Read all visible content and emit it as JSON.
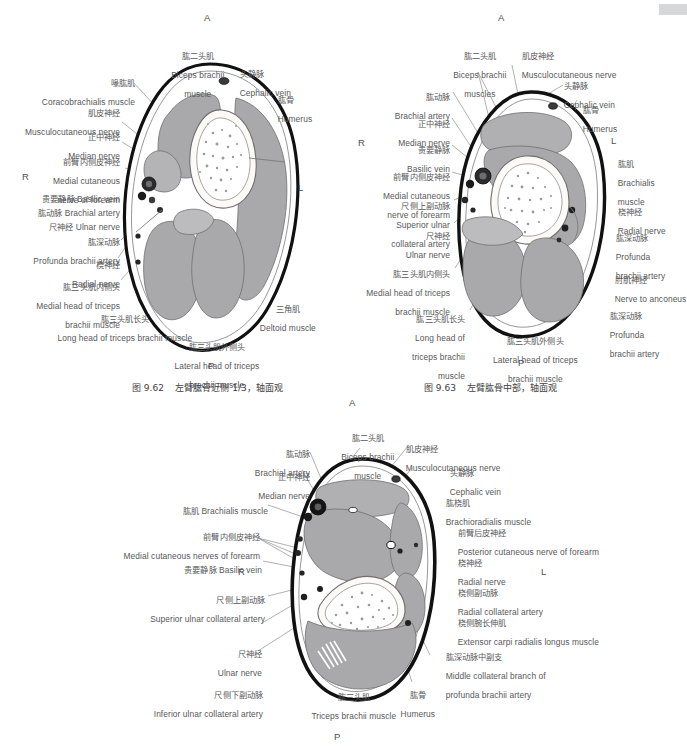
{
  "page": {
    "corner_mark_color": "#d6d7d9",
    "text_color": "#57585a",
    "muscle_fill": "#a9a9ab",
    "muscle_fill_light": "#bcbcbe",
    "bone_fill": "#fbfaf6",
    "skin_outline": "#111111",
    "vessel_dark": "#1b1b1b"
  },
  "figures": [
    {
      "id": "fig-9-62",
      "caption": "图 9.62    左臂肱骨近侧 1/3，轴面观",
      "caption_number": "图 9.62",
      "caption_text": "左臂肱骨近侧 1/3，轴面观",
      "orientation": {
        "anterior": "A",
        "posterior": "P",
        "right": "R",
        "left": "L"
      },
      "labels": [
        {
          "cn": "肱二头肌",
          "en": "Biceps brachii\nmuscle",
          "align": "center"
        },
        {
          "cn": "喙肱肌",
          "en": "Coracobrachialis muscle",
          "align": "right"
        },
        {
          "cn": "肌皮神经",
          "en": "Musculocutaneous nerve",
          "align": "right"
        },
        {
          "cn": "正中神经",
          "en": "Median nerve",
          "align": "right"
        },
        {
          "cn": "前臂内侧皮神经",
          "en": "Medial cutaneous\nnerve of forearm",
          "align": "right"
        },
        {
          "cn": "贵要静脉",
          "en": "Basilic vein",
          "align": "right"
        },
        {
          "cn": "肱动脉",
          "en": "Brachial artery",
          "align": "right"
        },
        {
          "cn": "尺神经",
          "en": "Ulnar nerve",
          "align": "right"
        },
        {
          "cn": "肱深动脉",
          "en": "Profunda brachii artery",
          "align": "right"
        },
        {
          "cn": "桡神经",
          "en": "Radial nerve",
          "align": "right"
        },
        {
          "cn": "肱三头肌内侧头",
          "en": "Medial head of triceps\nbrachii muscle",
          "align": "right"
        },
        {
          "cn": "肱三头肌长头",
          "en": "Long head of triceps brachii muscle",
          "align": "right"
        },
        {
          "cn": "肱三头肌外侧头",
          "en": "Lateral head of triceps\nbrachii muscle",
          "align": "center"
        },
        {
          "cn": "三角肌",
          "en": "Deltoid muscle",
          "align": "left"
        },
        {
          "cn": "头静脉",
          "en": "Cephalic vein",
          "align": "left"
        },
        {
          "cn": "肱骨",
          "en": "Humerus",
          "align": "left"
        }
      ]
    },
    {
      "id": "fig-9-63",
      "caption": "图 9.63    左臂肱骨中部，轴面观",
      "caption_number": "图 9.63",
      "caption_text": "左臂肱骨中部，轴面观",
      "orientation": {
        "anterior": "A",
        "posterior": "P",
        "right": "R",
        "left": "L"
      },
      "labels": [
        {
          "cn": "肱二头肌",
          "en": "Biceps brachii\nmuscles",
          "align": "center"
        },
        {
          "cn": "肌皮神经",
          "en": "Musculocutaneous nerve",
          "align": "left"
        },
        {
          "cn": "头静脉",
          "en": "Cephalic vein",
          "align": "left"
        },
        {
          "cn": "肱骨",
          "en": "Humerus",
          "align": "left"
        },
        {
          "cn": "肱动脉",
          "en": "Brachial artery",
          "align": "right"
        },
        {
          "cn": "正中神经",
          "en": "Median nerve",
          "align": "right"
        },
        {
          "cn": "贵要静脉",
          "en": "Basilic vein",
          "align": "right"
        },
        {
          "cn": "前臂内侧皮神经",
          "en": "Medial cutaneous\nnerve of forearm",
          "align": "right"
        },
        {
          "cn": "尺侧上副动脉",
          "en": "Superior ulnar\ncollateral artery",
          "align": "right"
        },
        {
          "cn": "尺神经",
          "en": "Ulnar nerve",
          "align": "right"
        },
        {
          "cn": "肱三头肌内侧头",
          "en": "Medial head of triceps\nbrachii muscle",
          "align": "right"
        },
        {
          "cn": "肱三头肌长头",
          "en": "Long head of\ntriceps brachii\nmuscle",
          "align": "right"
        },
        {
          "cn": "肱三头肌外侧头",
          "en": "Lateral head of triceps\nbrachii muscle",
          "align": "center"
        },
        {
          "cn": "肱肌",
          "en": "Brachialis\nmuscle",
          "align": "left"
        },
        {
          "cn": "桡神经",
          "en": "Radial nerve",
          "align": "left"
        },
        {
          "cn": "肱深动脉",
          "en": "Profunda\nbrachii artery",
          "align": "left"
        },
        {
          "cn": "肘肌神经",
          "en": "Nerve to anconeus",
          "align": "left"
        },
        {
          "cn": "肱深动脉",
          "en": "Profunda\nbrachii artery",
          "align": "left"
        }
      ]
    },
    {
      "id": "fig-9-64",
      "caption": "",
      "orientation": {
        "anterior": "A",
        "posterior": "P",
        "right": "R",
        "left": "L"
      },
      "labels": [
        {
          "cn": "肱二头肌",
          "en": "Biceps brachii\nmuscle",
          "align": "center"
        },
        {
          "cn": "肱动脉",
          "en": "Brachial artery",
          "align": "right"
        },
        {
          "cn": "正中神经",
          "en": "Median nerve",
          "align": "right"
        },
        {
          "cn": "肱肌",
          "en": "Brachialis muscle",
          "align": "right",
          "inline": true
        },
        {
          "cn": "前臂内侧皮神经",
          "en": "Medial cutaneous nerves of forearm",
          "align": "right"
        },
        {
          "cn": "贵要静脉",
          "en": "Basilic vein",
          "align": "right",
          "inline": true
        },
        {
          "cn": "尺侧上副动脉",
          "en": "Superior ulnar collateral artery",
          "align": "right"
        },
        {
          "cn": "尺神经",
          "en": "Ulnar nerve",
          "align": "right"
        },
        {
          "cn": "尺侧下副动脉",
          "en": "Inferior ulnar collateral artery",
          "align": "right"
        },
        {
          "cn": "肱三头肌",
          "en": "Triceps brachii muscle",
          "align": "center"
        },
        {
          "cn": "肱骨",
          "en": "Humerus",
          "align": "center"
        },
        {
          "cn": "肌皮神经",
          "en": "Musculocutaneous nerve",
          "align": "left"
        },
        {
          "cn": "头静脉",
          "en": "Cephalic vein",
          "align": "left"
        },
        {
          "cn": "肱桡肌",
          "en": "Brachioradialis muscle",
          "align": "left"
        },
        {
          "cn": "前臂后皮神经",
          "en": "Posterior cutaneous nerve of forearm",
          "align": "left"
        },
        {
          "cn": "桡神经",
          "en": "Radial nerve",
          "align": "left"
        },
        {
          "cn": "桡侧副动脉",
          "en": "Radial collateral artery",
          "align": "left"
        },
        {
          "cn": "桡侧腕长伸肌",
          "en": "Extensor carpi radialis longus muscle",
          "align": "left"
        },
        {
          "cn": "肱深动脉中副支",
          "en": "Middle collateral branch of\nprofunda brachii artery",
          "align": "left"
        }
      ]
    }
  ],
  "fig1": {
    "orient_a": "A",
    "orient_p": "P",
    "orient_r": "R",
    "orient_l": "L",
    "caption": "图 9.62    左臂肱骨近侧 1/3，轴面观",
    "biceps_cn": "肱二头肌",
    "biceps_en1": "Biceps brachii",
    "biceps_en2": "muscle",
    "coraco_cn": "喙肱肌",
    "coraco_en": "Coracobrachialis muscle",
    "mcn_cn": "肌皮神经",
    "mcn_en": "Musculocutaneous nerve",
    "median_cn": "正中神经",
    "median_en": "Median nerve",
    "mcnf_cn": "前臂内侧皮神经",
    "mcnf_en1": "Medial cutaneous",
    "mcnf_en2": "nerve of forearm",
    "basilic_cn": "贵要静脉",
    "basilic_en": "Basilic vein",
    "brachial_cn": "肱动脉",
    "brachial_en": "Brachial artery",
    "ulnar_cn": "尺神经",
    "ulnar_en": "Ulnar nerve",
    "profunda_cn": "肱深动脉",
    "profunda_en": "Profunda brachii artery",
    "radial_cn": "桡神经",
    "radial_en": "Radial nerve",
    "medtri_cn": "肱三头肌内侧头",
    "medtri_en1": "Medial head of triceps",
    "medtri_en2": "brachii muscle",
    "longtri_cn": "肱三头肌长头",
    "longtri_en": "Long head of triceps brachii muscle",
    "lattri_cn": "肱三头肌外侧头",
    "lattri_en1": "Lateral head of triceps",
    "lattri_en2": "brachii muscle",
    "deltoid_cn": "三角肌",
    "deltoid_en": "Deltoid muscle",
    "cephalic_cn": "头静脉",
    "cephalic_en": "Cephalic vein",
    "humerus_cn": "肱骨",
    "humerus_en": "Humerus"
  },
  "fig2": {
    "orient_a": "A",
    "orient_p": "P",
    "orient_r": "R",
    "orient_l": "L",
    "caption": "图 9.63    左臂肱骨中部，轴面观",
    "biceps_cn": "肱二头肌",
    "biceps_en1": "Biceps brachii",
    "biceps_en2": "muscles",
    "mcn_cn": "肌皮神经",
    "mcn_en": "Musculocutaneous nerve",
    "cephalic_cn": "头静脉",
    "cephalic_en": "Cephalic vein",
    "humerus_cn": "肱骨",
    "humerus_en": "Humerus",
    "brachial_cn": "肱动脉",
    "brachial_en": "Brachial artery",
    "median_cn": "正中神经",
    "median_en": "Median nerve",
    "basilic_cn": "贵要静脉",
    "basilic_en": "Basilic vein",
    "mcnf_cn": "前臂内侧皮神经",
    "mcnf_en1": "Medial cutaneous",
    "mcnf_en2": "nerve of forearm",
    "suca_cn": "尺侧上副动脉",
    "suca_en1": "Superior ulnar",
    "suca_en2": "collateral artery",
    "ulnar_cn": "尺神经",
    "ulnar_en": "Ulnar nerve",
    "medtri_cn": "肱三头肌内侧头",
    "medtri_en1": "Medial head of triceps",
    "medtri_en2": "brachii muscle",
    "longtri_cn": "肱三头肌长头",
    "longtri_en1": "Long head of",
    "longtri_en2": "triceps brachii",
    "longtri_en3": "muscle",
    "lattri_cn": "肱三头肌外侧头",
    "lattri_en1": "Lateral head of triceps",
    "lattri_en2": "brachii muscle",
    "brachialis_cn": "肱肌",
    "brachialis_en1": "Brachialis",
    "brachialis_en2": "muscle",
    "radial_cn": "桡神经",
    "radial_en": "Radial nerve",
    "profunda1_cn": "肱深动脉",
    "profunda1_en1": "Profunda",
    "profunda1_en2": "brachii artery",
    "anconeus_cn": "肘肌神经",
    "anconeus_en": "Nerve to anconeus",
    "profunda2_cn": "肱深动脉",
    "profunda2_en1": "Profunda",
    "profunda2_en2": "brachii artery"
  },
  "fig3": {
    "orient_a": "A",
    "orient_p": "P",
    "orient_r": "R",
    "orient_l": "L",
    "biceps_cn": "肱二头肌",
    "biceps_en1": "Biceps brachii",
    "biceps_en2": "muscle",
    "brachial_cn": "肱动脉",
    "brachial_en": "Brachial artery",
    "median_cn": "正中神经",
    "median_en": "Median nerve",
    "brachialis_cn": "肱肌",
    "brachialis_en": "Brachialis muscle",
    "mcnf_cn": "前臂内侧皮神经",
    "mcnf_en": "Medial cutaneous nerves of forearm",
    "basilic_cn": "贵要静脉",
    "basilic_en": "Basilic vein",
    "suca_cn": "尺侧上副动脉",
    "suca_en": "Superior ulnar collateral artery",
    "ulnar_cn": "尺神经",
    "ulnar_en": "Ulnar nerve",
    "iuca_cn": "尺侧下副动脉",
    "iuca_en": "Inferior ulnar collateral artery",
    "triceps_cn": "肱三头肌",
    "triceps_en": "Triceps brachii muscle",
    "humerus_cn": "肱骨",
    "humerus_en": "Humerus",
    "mcn_cn": "肌皮神经",
    "mcn_en": "Musculocutaneous nerve",
    "cephalic_cn": "头静脉",
    "cephalic_en": "Cephalic vein",
    "brachiorad_cn": "肱桡肌",
    "brachiorad_en": "Brachioradialis muscle",
    "pcnf_cn": "前臂后皮神经",
    "pcnf_en": "Posterior cutaneous nerve of forearm",
    "radial_cn": "桡神经",
    "radial_en": "Radial nerve",
    "rca_cn": "桡侧副动脉",
    "rca_en": "Radial collateral artery",
    "ecrl_cn": "桡侧腕长伸肌",
    "ecrl_en": "Extensor carpi radialis longus muscle",
    "mcb_cn": "肱深动脉中副支",
    "mcb_en1": "Middle collateral branch of",
    "mcb_en2": "profunda brachii artery"
  }
}
